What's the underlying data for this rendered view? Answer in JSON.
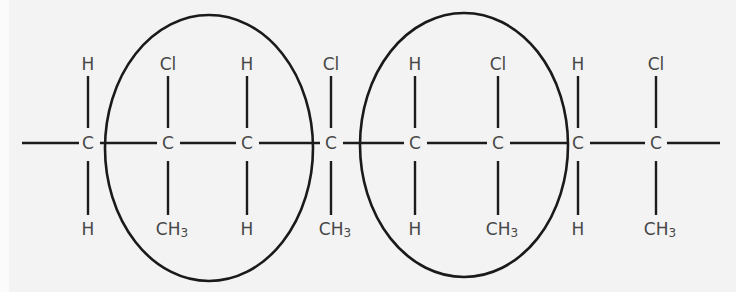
{
  "diagram": {
    "type": "polymer-structure",
    "colors": {
      "background": "#f3f3f3",
      "bond": "#1c1c1c",
      "ring": "#1a1a1a",
      "atom_text": "#474747"
    },
    "chain_y": 143,
    "top_label_y": 64,
    "bottom_label_y": 229,
    "end_bonds": [
      {
        "x1": 22,
        "x2": 79
      },
      {
        "x1": 667,
        "x2": 720
      }
    ],
    "carbons": [
      {
        "x": 88,
        "label": "C",
        "top": "H",
        "bottom": "H"
      },
      {
        "x": 168,
        "label": "C",
        "top": "Cl",
        "bottom": "CH3"
      },
      {
        "x": 247,
        "label": "C",
        "top": "H",
        "bottom": "H"
      },
      {
        "x": 331,
        "label": "C",
        "top": "Cl",
        "bottom": "CH3"
      },
      {
        "x": 415,
        "label": "C",
        "top": "H",
        "bottom": "H"
      },
      {
        "x": 498,
        "label": "C",
        "top": "Cl",
        "bottom": "CH3"
      },
      {
        "x": 578,
        "label": "C",
        "top": "H",
        "bottom": "H"
      },
      {
        "x": 656,
        "label": "C",
        "top": "Cl",
        "bottom": "CH3"
      }
    ],
    "repeat_unit_circles": [
      {
        "cx": 209,
        "cy": 148,
        "rx": 104,
        "ry": 133
      },
      {
        "cx": 464,
        "cy": 145,
        "rx": 104,
        "ry": 132
      }
    ]
  }
}
